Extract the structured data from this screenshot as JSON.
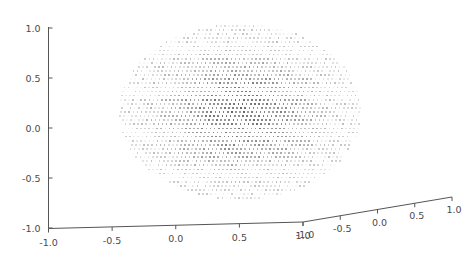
{
  "figure": {
    "background_color": "#ffffff",
    "axis_color": "#555555",
    "tick_label_color": "#4a4a4a",
    "point_color": "#4d4d4d"
  },
  "chart_data": {
    "type": "scatter",
    "projection": "3d",
    "title": "",
    "xlabel": "",
    "ylabel": "",
    "zlabel": "",
    "grid": false,
    "legend": null,
    "axes": [
      {
        "name": "z-axis",
        "orientation": "vertical-left",
        "range": [
          -1.0,
          1.0
        ],
        "ticks": [
          1.0,
          0.5,
          0.0,
          -0.5,
          -1.0
        ],
        "tick_labels": [
          "1.0",
          "0.5",
          "0.0",
          "-0.5",
          "-1.0"
        ]
      },
      {
        "name": "x-axis",
        "orientation": "bottom-left-receding",
        "range": [
          -1.0,
          1.0
        ],
        "ticks": [
          -1.0,
          -0.5,
          0.0,
          0.5,
          1.0
        ],
        "tick_labels": [
          "-1.0",
          "-0.5",
          "0.0",
          "0.5",
          "1.0"
        ]
      },
      {
        "name": "y-axis",
        "orientation": "bottom-right-ascending",
        "range": [
          -1.0,
          1.0
        ],
        "ticks": [
          -1.0,
          -0.5,
          0.0,
          0.5,
          1.0
        ],
        "tick_labels": [
          "-1.0",
          "-0.5",
          "0.0",
          "0.5",
          "1.0"
        ]
      }
    ],
    "z_axis_ticks": [
      "1.0",
      "0.5",
      "0.0",
      "-0.5",
      "-1.0"
    ],
    "x_axis_ticks": [
      "-1.0",
      "-0.5",
      "0.0",
      "0.5",
      "1.0"
    ],
    "y_axis_ticks": [
      "-1.0",
      "-0.5",
      "0.0",
      "0.5",
      "1.0"
    ],
    "point_cloud": {
      "shape": "ellipse",
      "lattice": "regular-grid",
      "center_px": [
        240,
        112
      ],
      "radius_x_px": 121,
      "radius_y_px": 88,
      "point_size_px": 1.7,
      "grid_step_px": 4.1,
      "core_darkness": 0.72,
      "edge_darkness": 0.1
    }
  }
}
